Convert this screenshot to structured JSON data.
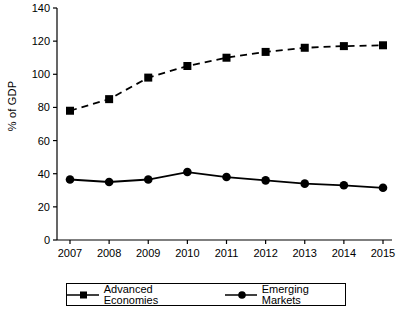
{
  "chart_data": {
    "type": "line",
    "title": "",
    "xlabel": "",
    "ylabel": "% of GDP",
    "categories": [
      "2007",
      "2008",
      "2009",
      "2010",
      "2011",
      "2012",
      "2013",
      "2014",
      "2015"
    ],
    "ylim": [
      0,
      140
    ],
    "ytick_values": [
      0,
      20,
      40,
      60,
      80,
      100,
      120,
      140
    ],
    "ytick_labels": [
      "0",
      "20",
      "40",
      "60",
      "80",
      "100",
      "120",
      "140"
    ],
    "grid": false,
    "legend_position": "bottom",
    "series": [
      {
        "name": "Advanced Economies",
        "marker": "square",
        "linestyle": "dashed",
        "color": "#000000",
        "values": [
          78,
          85,
          98,
          105,
          110,
          113.5,
          116,
          117,
          117.5
        ]
      },
      {
        "name": "Emerging Markets",
        "marker": "circle",
        "linestyle": "solid",
        "color": "#000000",
        "values": [
          36.5,
          35,
          36.5,
          41,
          38,
          36,
          34,
          33,
          31.5
        ]
      }
    ]
  },
  "axis": {
    "y_title": "% of GDP"
  },
  "legend": {
    "items": [
      {
        "label": "Advanced Economies"
      },
      {
        "label": "Emerging Markets"
      }
    ]
  }
}
